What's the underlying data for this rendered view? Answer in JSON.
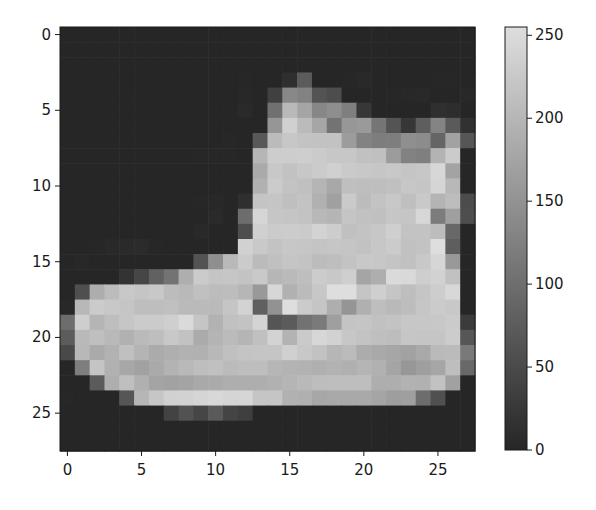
{
  "figure": {
    "title": "",
    "colormap": "gray"
  },
  "chart_data": {
    "type": "heatmap",
    "title": "",
    "xlabel": "",
    "ylabel": "",
    "x_ticks": [
      0,
      5,
      10,
      15,
      20,
      25
    ],
    "y_ticks": [
      0,
      5,
      10,
      15,
      20,
      25
    ],
    "xlim": [
      -0.5,
      27.5
    ],
    "ylim": [
      27.5,
      -0.5
    ],
    "rows": 28,
    "cols": 28,
    "colorbar": {
      "ticks": [
        0,
        50,
        100,
        150,
        200,
        250
      ],
      "range": [
        0,
        255
      ],
      "colormap": "gray"
    },
    "grid": false,
    "z": [
      [
        0,
        0,
        0,
        0,
        0,
        0,
        0,
        0,
        0,
        0,
        0,
        0,
        0,
        0,
        0,
        0,
        0,
        0,
        0,
        0,
        0,
        0,
        0,
        0,
        0,
        0,
        0,
        0
      ],
      [
        0,
        0,
        0,
        0,
        0,
        0,
        0,
        0,
        0,
        0,
        0,
        0,
        0,
        0,
        0,
        0,
        0,
        0,
        0,
        0,
        0,
        0,
        0,
        0,
        0,
        0,
        0,
        0
      ],
      [
        0,
        0,
        0,
        0,
        0,
        0,
        0,
        0,
        0,
        0,
        0,
        0,
        0,
        0,
        0,
        0,
        0,
        0,
        0,
        0,
        0,
        0,
        0,
        0,
        0,
        0,
        0,
        0
      ],
      [
        0,
        0,
        0,
        0,
        0,
        0,
        0,
        0,
        0,
        0,
        0,
        0,
        1,
        0,
        0,
        13,
        73,
        0,
        0,
        1,
        4,
        0,
        0,
        0,
        0,
        1,
        1,
        0
      ],
      [
        0,
        0,
        0,
        0,
        0,
        0,
        0,
        0,
        0,
        0,
        0,
        0,
        3,
        0,
        36,
        136,
        127,
        62,
        54,
        0,
        0,
        0,
        1,
        3,
        4,
        0,
        0,
        3
      ],
      [
        0,
        0,
        0,
        0,
        0,
        0,
        0,
        0,
        0,
        0,
        0,
        0,
        6,
        0,
        102,
        204,
        176,
        134,
        144,
        123,
        23,
        0,
        0,
        0,
        0,
        12,
        10,
        0
      ],
      [
        0,
        0,
        0,
        0,
        0,
        0,
        0,
        0,
        0,
        0,
        0,
        0,
        0,
        0,
        155,
        236,
        207,
        178,
        107,
        156,
        161,
        109,
        64,
        23,
        77,
        130,
        72,
        15
      ],
      [
        0,
        0,
        0,
        0,
        0,
        0,
        0,
        0,
        0,
        0,
        0,
        1,
        0,
        69,
        207,
        223,
        218,
        216,
        216,
        163,
        127,
        121,
        122,
        146,
        141,
        88,
        172,
        66
      ],
      [
        0,
        0,
        0,
        0,
        0,
        0,
        0,
        0,
        0,
        1,
        1,
        1,
        0,
        200,
        232,
        232,
        233,
        229,
        223,
        223,
        215,
        213,
        164,
        127,
        123,
        196,
        229,
        0
      ],
      [
        0,
        0,
        0,
        0,
        0,
        0,
        0,
        0,
        0,
        0,
        0,
        0,
        0,
        183,
        225,
        216,
        223,
        228,
        235,
        227,
        224,
        222,
        224,
        221,
        223,
        245,
        173,
        0
      ],
      [
        0,
        0,
        0,
        0,
        0,
        0,
        0,
        0,
        0,
        0,
        0,
        0,
        0,
        193,
        228,
        218,
        213,
        198,
        180,
        212,
        210,
        211,
        213,
        223,
        220,
        243,
        202,
        0
      ],
      [
        0,
        0,
        0,
        0,
        0,
        0,
        0,
        0,
        0,
        1,
        3,
        0,
        12,
        219,
        220,
        212,
        218,
        192,
        169,
        227,
        208,
        218,
        224,
        212,
        226,
        197,
        209,
        52
      ],
      [
        0,
        0,
        0,
        0,
        0,
        0,
        0,
        0,
        0,
        0,
        6,
        0,
        99,
        244,
        222,
        220,
        218,
        203,
        198,
        221,
        215,
        213,
        222,
        220,
        245,
        119,
        167,
        56
      ],
      [
        0,
        0,
        0,
        0,
        0,
        0,
        0,
        0,
        0,
        4,
        0,
        0,
        55,
        236,
        228,
        230,
        228,
        240,
        232,
        213,
        218,
        223,
        234,
        217,
        217,
        209,
        92,
        0
      ],
      [
        0,
        0,
        1,
        4,
        6,
        7,
        2,
        0,
        0,
        0,
        0,
        0,
        237,
        226,
        217,
        223,
        222,
        219,
        222,
        221,
        216,
        223,
        229,
        215,
        218,
        255,
        77,
        0
      ],
      [
        0,
        3,
        0,
        0,
        0,
        0,
        0,
        0,
        0,
        62,
        145,
        204,
        228,
        207,
        213,
        221,
        218,
        208,
        211,
        218,
        224,
        223,
        219,
        215,
        224,
        244,
        159,
        0
      ],
      [
        0,
        0,
        0,
        0,
        18,
        44,
        82,
        107,
        189,
        228,
        220,
        222,
        217,
        226,
        200,
        205,
        211,
        230,
        224,
        234,
        176,
        188,
        250,
        248,
        233,
        238,
        215,
        0
      ],
      [
        0,
        57,
        187,
        208,
        224,
        221,
        224,
        208,
        204,
        214,
        208,
        209,
        200,
        159,
        245,
        193,
        206,
        223,
        255,
        255,
        221,
        234,
        221,
        211,
        220,
        232,
        246,
        0
      ],
      [
        3,
        202,
        228,
        224,
        221,
        211,
        211,
        214,
        205,
        205,
        205,
        220,
        240,
        80,
        150,
        255,
        229,
        221,
        188,
        154,
        191,
        210,
        204,
        209,
        222,
        228,
        225,
        0
      ],
      [
        98,
        233,
        198,
        210,
        222,
        229,
        229,
        234,
        249,
        220,
        194,
        215,
        217,
        241,
        65,
        73,
        106,
        117,
        168,
        219,
        221,
        215,
        217,
        223,
        223,
        224,
        229,
        29
      ],
      [
        75,
        204,
        212,
        204,
        193,
        205,
        211,
        225,
        216,
        185,
        197,
        206,
        198,
        213,
        240,
        195,
        227,
        245,
        239,
        223,
        218,
        212,
        209,
        222,
        220,
        221,
        230,
        67
      ],
      [
        48,
        203,
        183,
        194,
        213,
        197,
        185,
        190,
        194,
        192,
        202,
        214,
        219,
        221,
        220,
        236,
        225,
        216,
        199,
        206,
        186,
        181,
        177,
        172,
        181,
        205,
        206,
        115
      ],
      [
        0,
        122,
        219,
        193,
        179,
        171,
        183,
        196,
        204,
        210,
        213,
        207,
        211,
        210,
        200,
        196,
        194,
        191,
        195,
        191,
        198,
        192,
        176,
        156,
        167,
        177,
        210,
        92
      ],
      [
        0,
        0,
        74,
        189,
        212,
        191,
        175,
        172,
        175,
        181,
        185,
        188,
        189,
        188,
        193,
        198,
        204,
        209,
        210,
        210,
        211,
        188,
        188,
        194,
        192,
        216,
        170,
        0
      ],
      [
        2,
        0,
        0,
        0,
        66,
        200,
        222,
        237,
        239,
        242,
        246,
        243,
        244,
        221,
        220,
        193,
        191,
        179,
        182,
        182,
        181,
        176,
        166,
        168,
        99,
        58,
        0,
        0
      ],
      [
        0,
        0,
        0,
        0,
        0,
        0,
        0,
        40,
        61,
        44,
        72,
        41,
        35,
        0,
        0,
        0,
        0,
        0,
        0,
        0,
        0,
        0,
        0,
        0,
        0,
        0,
        0,
        0
      ],
      [
        0,
        0,
        0,
        0,
        0,
        0,
        0,
        0,
        0,
        0,
        0,
        0,
        0,
        0,
        0,
        0,
        0,
        0,
        0,
        0,
        0,
        0,
        0,
        0,
        0,
        0,
        0,
        0
      ],
      [
        0,
        0,
        0,
        0,
        0,
        0,
        0,
        0,
        0,
        0,
        0,
        0,
        0,
        0,
        0,
        0,
        0,
        0,
        0,
        0,
        0,
        0,
        0,
        0,
        0,
        0,
        0,
        0
      ]
    ]
  },
  "style": {
    "cmap_low": "#262626",
    "cmap_high": "#dedede",
    "axis_color": "#1a1a1a",
    "background": "#ffffff"
  }
}
